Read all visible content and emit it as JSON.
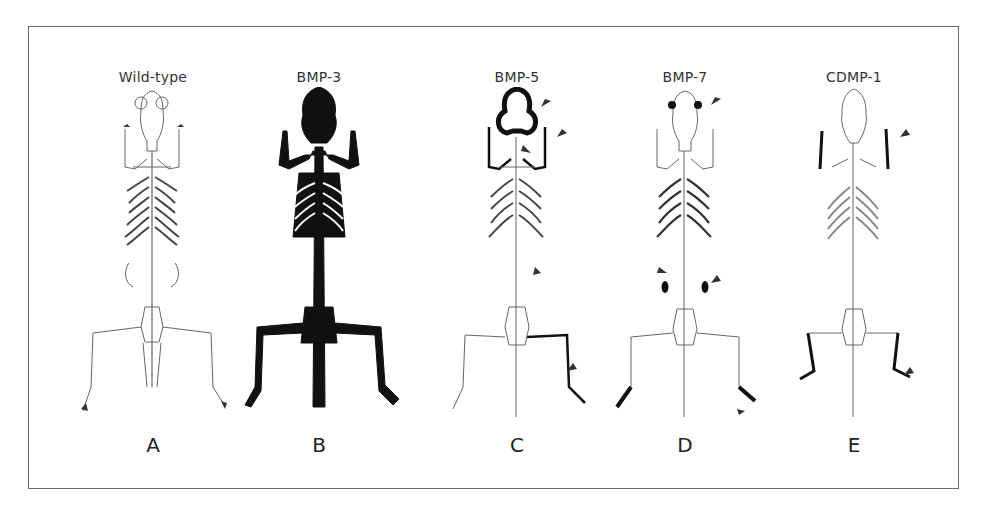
{
  "figure": {
    "panels": [
      {
        "id": "A",
        "title": "Wild-type",
        "letter": "A",
        "center_x": 152,
        "highlight": [],
        "arrows": []
      },
      {
        "id": "B",
        "title": "BMP-3",
        "letter": "B",
        "center_x": 318,
        "highlight": [
          "skull",
          "spine",
          "forelimbs",
          "hindlimbs",
          "pelvis",
          "ribcage"
        ],
        "arrows": []
      },
      {
        "id": "C",
        "title": "BMP-5",
        "letter": "C",
        "center_x": 516,
        "highlight": [
          "skull-outline",
          "forelimbs",
          "hindlimb-right",
          "hindlimb-upper"
        ],
        "arrows": [
          "skull",
          "forelimb",
          "neck",
          "ribs",
          "hindlimb"
        ]
      },
      {
        "id": "D",
        "title": "BMP-7",
        "letter": "D",
        "center_x": 684,
        "highlight": [
          "eyes",
          "kidneys",
          "hindfeet",
          "forepaws"
        ],
        "arrows": [
          "eye",
          "kidney-left",
          "kidney-right",
          "hindfoot"
        ]
      },
      {
        "id": "E",
        "title": "CDMP-1",
        "letter": "E",
        "center_x": 853,
        "highlight": [
          "forelimbs-distal",
          "hindlimbs-distal"
        ],
        "arrows": [
          "forelimb",
          "hindlimb"
        ]
      }
    ]
  },
  "colors": {
    "frame": "#6a6a6a",
    "ink": "#111111",
    "outline": "#555555",
    "arrow": "#333333"
  }
}
